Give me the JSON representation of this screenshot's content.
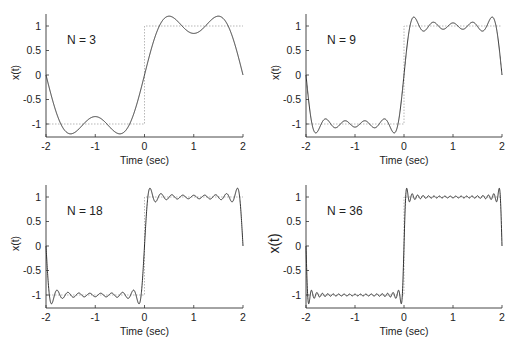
{
  "figure": {
    "xlabel": "Time (sec)",
    "ylabel": "x(t)",
    "xticks": [
      "-2",
      "-1",
      "0",
      "1",
      "2"
    ],
    "yticks": [
      "1",
      "0.5",
      "0",
      "-0.5",
      "-1"
    ]
  },
  "chart_data": [
    {
      "type": "line",
      "title": "N = 3",
      "annotation": "N = 3",
      "xlabel": "Time (sec)",
      "ylabel": "x(t)",
      "xlim": [
        -2,
        2
      ],
      "ylim": [
        -1.25,
        1.25
      ],
      "xticks": [
        -2,
        -1,
        0,
        1,
        2
      ],
      "yticks": [
        -1,
        -0.5,
        0,
        0.5,
        1
      ],
      "grid": false,
      "series": [
        {
          "name": "Fourier partial sum",
          "style": "solid",
          "description": "square wave Fourier series, odd harmonics up to k=3",
          "x": [
            -2,
            -1.5,
            -1,
            -0.5,
            -0.25,
            0,
            0.25,
            0.5,
            1,
            1.5,
            2
          ],
          "y": [
            -0.9,
            -1.1,
            -0.85,
            -1.18,
            -0.75,
            0,
            0.75,
            1.18,
            0.85,
            1.1,
            0.9
          ]
        },
        {
          "name": "Square wave",
          "style": "dotted",
          "x": [
            -2,
            0,
            0,
            2
          ],
          "y": [
            -1,
            -1,
            1,
            1
          ]
        }
      ],
      "harmonics": 3
    },
    {
      "type": "line",
      "title": "N = 9",
      "annotation": "N = 9",
      "xlabel": "Time (sec)",
      "ylabel": "x(t)",
      "xlim": [
        -2,
        2
      ],
      "ylim": [
        -1.25,
        1.25
      ],
      "xticks": [
        -2,
        -1,
        0,
        1,
        2
      ],
      "yticks": [
        -1,
        -0.5,
        0,
        0.5,
        1
      ],
      "grid": false,
      "series": [
        {
          "name": "Fourier partial sum",
          "style": "solid",
          "description": "odd harmonics up to k=9; Gibbs overshoot ~1.17 near t=0.15",
          "x": [
            -2,
            -0.15,
            0,
            0.15,
            2
          ],
          "y": [
            -1.0,
            -1.17,
            0,
            1.17,
            1.0
          ]
        },
        {
          "name": "Square wave",
          "style": "dotted",
          "x": [
            -2,
            0,
            0,
            2
          ],
          "y": [
            -1,
            -1,
            1,
            1
          ]
        }
      ],
      "harmonics": 9
    },
    {
      "type": "line",
      "title": "N = 18",
      "annotation": "N = 18",
      "xlabel": "Time (sec)",
      "ylabel": "x(t)",
      "xlim": [
        -2,
        2
      ],
      "ylim": [
        -1.25,
        1.25
      ],
      "xticks": [
        -2,
        -1,
        0,
        1,
        2
      ],
      "yticks": [
        -1,
        -0.5,
        0,
        0.5,
        1
      ],
      "grid": false,
      "series": [
        {
          "name": "Fourier partial sum",
          "style": "solid",
          "description": "odd harmonics up to k=18; Gibbs overshoot ~1.18 near t=0.08",
          "x": [
            -2,
            -0.08,
            0,
            0.08,
            2
          ],
          "y": [
            -1.0,
            -1.18,
            0,
            1.18,
            1.0
          ]
        },
        {
          "name": "Square wave",
          "style": "dotted",
          "x": [
            -2,
            0,
            0,
            2
          ],
          "y": [
            -1,
            -1,
            1,
            1
          ]
        }
      ],
      "harmonics": 18
    },
    {
      "type": "line",
      "title": "N = 36",
      "annotation": "N = 36",
      "xlabel": "Time (sec)",
      "ylabel": "x(t)",
      "xlim": [
        -2,
        2
      ],
      "ylim": [
        -1.25,
        1.25
      ],
      "xticks": [
        -2,
        -1,
        0,
        1,
        2
      ],
      "yticks": [
        -1,
        -0.5,
        0,
        0.5,
        1
      ],
      "grid": false,
      "series": [
        {
          "name": "Fourier partial sum",
          "style": "solid",
          "description": "odd harmonics up to k=36; Gibbs overshoot ~1.18 near t=0.04",
          "x": [
            -2,
            -0.04,
            0,
            0.04,
            2
          ],
          "y": [
            -1.0,
            -1.18,
            0,
            1.18,
            1.0
          ]
        },
        {
          "name": "Square wave",
          "style": "dotted",
          "x": [
            -2,
            0,
            0,
            2
          ],
          "y": [
            -1,
            -1,
            1,
            1
          ]
        }
      ],
      "harmonics": 36
    }
  ],
  "panels": [
    {
      "label": "N = 3",
      "harmonics": 3,
      "left": 46,
      "top": 14,
      "right": 243,
      "bottom": 137,
      "ylabel_large": false
    },
    {
      "label": "N = 9",
      "harmonics": 9,
      "left": 306,
      "top": 14,
      "right": 502,
      "bottom": 137,
      "ylabel_large": false
    },
    {
      "label": "N = 18",
      "harmonics": 18,
      "left": 46,
      "top": 185,
      "right": 243,
      "bottom": 308,
      "ylabel_large": false
    },
    {
      "label": "N = 36",
      "harmonics": 36,
      "left": 306,
      "top": 185,
      "right": 502,
      "bottom": 308,
      "ylabel_large": true
    }
  ],
  "colors": {
    "curve": "#1a1a1a",
    "square": "#9a9a9a",
    "axis": "#333333",
    "text": "#222222"
  }
}
